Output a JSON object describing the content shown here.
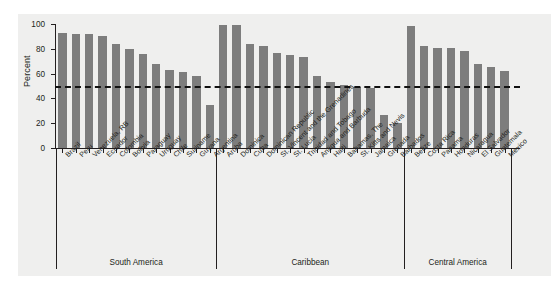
{
  "chart_data": {
    "type": "bar",
    "title": "",
    "xlabel": "",
    "ylabel": "Percent",
    "ylim": [
      0,
      100
    ],
    "yticks": [
      0,
      20,
      40,
      60,
      80,
      100
    ],
    "ytick_labels": [
      "0",
      "20",
      "40",
      "60",
      "80",
      "100"
    ],
    "grid": false,
    "legend": "none",
    "bar_color": "#7d7d7d",
    "reference_line": {
      "value": 50,
      "style": "dashed",
      "color": "#111111",
      "label": ""
    },
    "categories": [
      "Brazil",
      "Peru",
      "Venezuela, RB",
      "Ecuador",
      "Colombia",
      "Bolivia",
      "Paraguay",
      "Uruguay",
      "Chile",
      "Suriname",
      "Guyana",
      "Argentina",
      "Aruba",
      "Dominica",
      "Cuba",
      "Dominican Republic",
      "St. Vincent and the Grenadines",
      "St. Lucia",
      "Trinidad and Tobago",
      "Antigua and Barbuda",
      "Haiti",
      "Bahamas, The",
      "St. Kitts and Nevis",
      "Jamaica",
      "Grenada",
      "Barbados",
      "Belize",
      "Costa Rica",
      "Panama",
      "Honduras",
      "Nicaragua",
      "El Salvador",
      "Guatemala",
      "Mexico"
    ],
    "values": [
      93,
      92,
      92,
      90,
      84,
      80,
      76,
      68,
      63,
      61,
      58,
      35,
      99,
      99,
      84,
      82,
      77,
      75,
      73,
      58,
      53,
      51,
      49,
      48,
      27,
      20,
      98,
      82,
      81,
      81,
      78,
      68,
      65,
      62
    ],
    "groups": [
      {
        "label": "South America",
        "start_index": 0,
        "end_index": 11
      },
      {
        "label": "Caribbean",
        "start_index": 12,
        "end_index": 25
      },
      {
        "label": "Central America",
        "start_index": 26,
        "end_index": 33
      }
    ]
  },
  "axis": {
    "y_title": "Percent"
  }
}
